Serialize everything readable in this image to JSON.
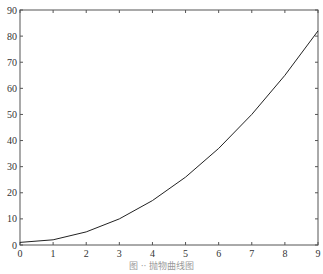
{
  "chart_data": {
    "type": "line",
    "title": "",
    "caption": "图 ‧‧ 抛物曲线图",
    "xlabel": "",
    "ylabel": "",
    "x": [
      0,
      1,
      2,
      3,
      4,
      5,
      6,
      7,
      8,
      9
    ],
    "series": [
      {
        "name": "y",
        "values": [
          1,
          2,
          5,
          10,
          17,
          26,
          37,
          50,
          65,
          82
        ],
        "color": "#222222"
      }
    ],
    "xlim": [
      0,
      9
    ],
    "ylim": [
      0,
      90
    ],
    "xticks": [
      0,
      1,
      2,
      3,
      4,
      5,
      6,
      7,
      8,
      9
    ],
    "yticks": [
      0,
      10,
      20,
      30,
      40,
      50,
      60,
      70,
      80,
      90
    ],
    "grid": false,
    "legend": null
  }
}
